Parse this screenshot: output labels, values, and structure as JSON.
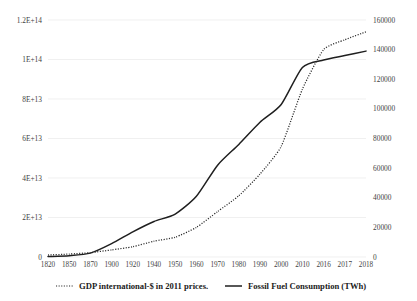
{
  "chart_data": {
    "type": "line",
    "title": "",
    "xlabel": "",
    "ylabel": "",
    "grid": true,
    "legend_position": "bottom",
    "categories": [
      "1820",
      "1850",
      "1870",
      "1900",
      "1920",
      "1940",
      "1950",
      "1960",
      "1970",
      "1980",
      "1990",
      "2000",
      "2010",
      "2016",
      "2017",
      "2018"
    ],
    "axes": {
      "left": {
        "label": "GDP international-$ in 2011 prices.",
        "ticks": [
          "0",
          "2E+13",
          "4E+13",
          "6E+13",
          "8E+13",
          "1E+14",
          "1.2E+14"
        ],
        "tick_values": [
          0,
          20000000000000,
          40000000000000,
          60000000000000,
          80000000000000,
          100000000000000,
          120000000000000
        ],
        "min": 0,
        "max": 120000000000000
      },
      "right": {
        "label": "Fossil Fuel Consumption (TWh)",
        "ticks": [
          "0",
          "20000",
          "40000",
          "60000",
          "80000",
          "100000",
          "120000",
          "140000",
          "160000"
        ],
        "tick_values": [
          0,
          20000,
          40000,
          60000,
          80000,
          100000,
          120000,
          140000,
          160000
        ],
        "min": 0,
        "max": 160000
      }
    },
    "series": [
      {
        "name": "GDP international-$ in 2011 prices.",
        "axis": "left",
        "style": "dotted",
        "color": "#262626",
        "values": [
          1000000000000,
          1500000000000,
          2200000000000,
          3600000000000,
          5200000000000,
          8000000000000,
          10000000000000,
          15000000000000,
          23000000000000,
          31000000000000,
          42000000000000,
          56000000000000,
          85000000000000,
          105000000000000,
          110000000000000,
          114000000000000
        ]
      },
      {
        "name": "Fossil Fuel Consumption (TWh)",
        "axis": "right",
        "style": "solid",
        "color": "#1f1f1f",
        "values": [
          300,
          900,
          2600,
          9000,
          17000,
          24000,
          29000,
          41000,
          62000,
          76000,
          91000,
          103000,
          128000,
          133000,
          136000,
          139000
        ]
      }
    ],
    "legend": [
      {
        "label": "GDP international-$ in 2011 prices.",
        "style": "dotted",
        "color": "#262626"
      },
      {
        "label": "Fossil Fuel Consumption (TWh)",
        "style": "solid",
        "color": "#1f1f1f"
      }
    ]
  }
}
